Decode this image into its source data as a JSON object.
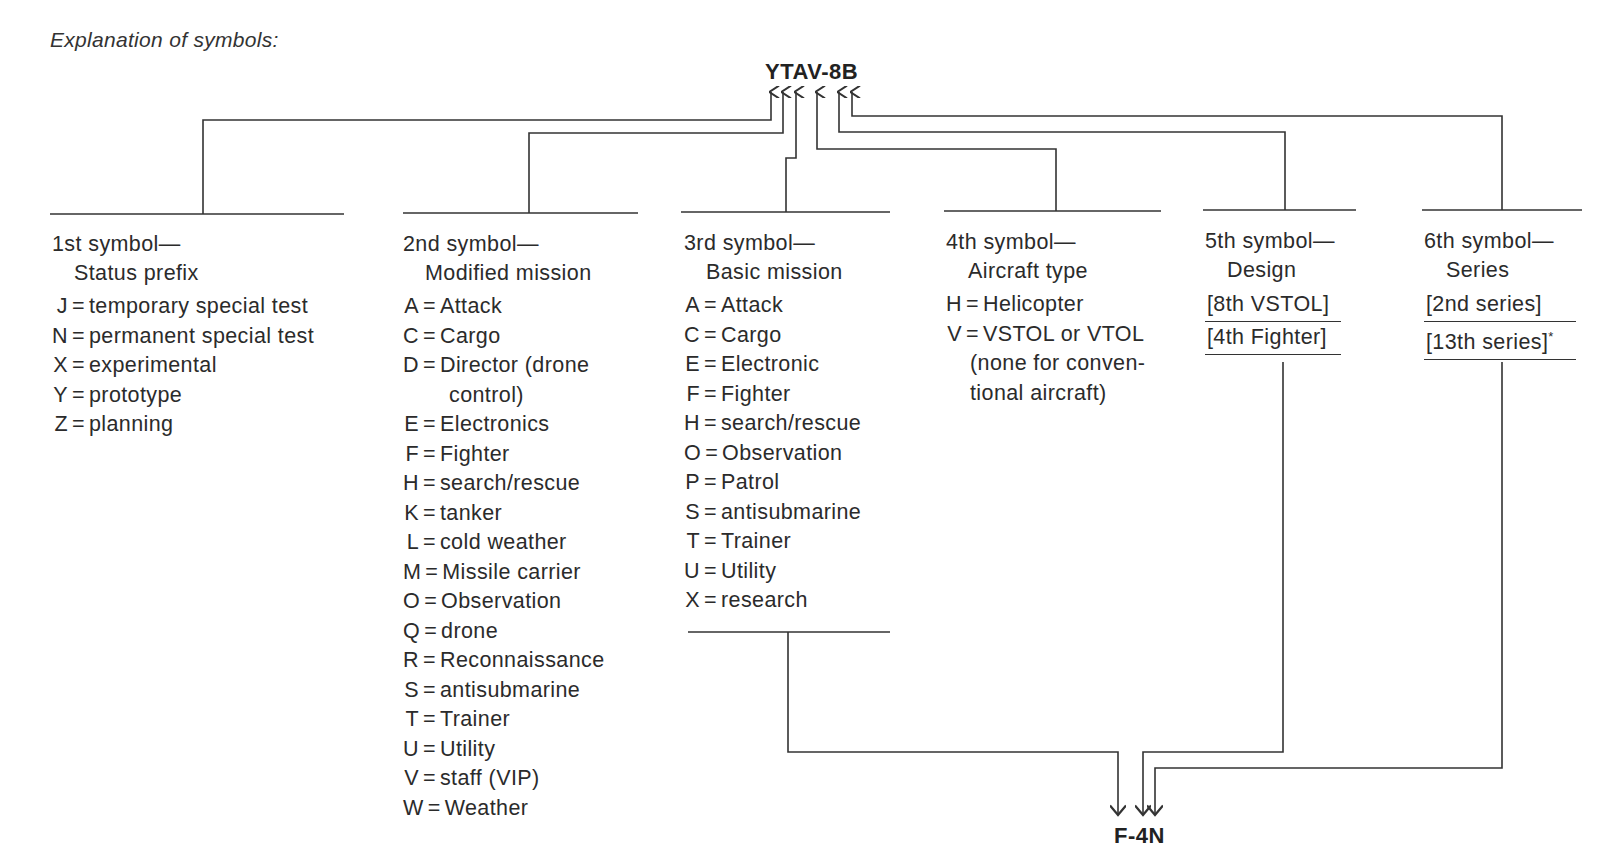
{
  "caption": "Explanation of symbols:",
  "example_top": "YTAV-8B",
  "example_bottom": "F-4N",
  "columns": [
    {
      "heading": "1st symbol—",
      "subheading": "Status prefix",
      "entries": [
        {
          "code": "J",
          "meaning": "temporary special test"
        },
        {
          "code": "N",
          "meaning": "permanent special test"
        },
        {
          "code": "X",
          "meaning": "experimental"
        },
        {
          "code": "Y",
          "meaning": "prototype"
        },
        {
          "code": "Z",
          "meaning": "planning"
        }
      ]
    },
    {
      "heading": "2nd symbol—",
      "subheading": "Modified mission",
      "entries": [
        {
          "code": "A",
          "meaning": "Attack"
        },
        {
          "code": "C",
          "meaning": "Cargo"
        },
        {
          "code": "D",
          "meaning": "Director (drone",
          "continuation": "control)"
        },
        {
          "code": "E",
          "meaning": "Electronics"
        },
        {
          "code": "F",
          "meaning": "Fighter"
        },
        {
          "code": "H",
          "meaning": "search/rescue"
        },
        {
          "code": "K",
          "meaning": "tanker"
        },
        {
          "code": "L",
          "meaning": "cold weather"
        },
        {
          "code": "M",
          "meaning": "Missile carrier"
        },
        {
          "code": "O",
          "meaning": "Observation"
        },
        {
          "code": "Q",
          "meaning": "drone"
        },
        {
          "code": "R",
          "meaning": "Reconnaissance"
        },
        {
          "code": "S",
          "meaning": "antisubmarine"
        },
        {
          "code": "T",
          "meaning": "Trainer"
        },
        {
          "code": "U",
          "meaning": "Utility"
        },
        {
          "code": "V",
          "meaning": "staff (VIP)"
        },
        {
          "code": "W",
          "meaning": "Weather"
        }
      ]
    },
    {
      "heading": "3rd symbol—",
      "subheading": "Basic mission",
      "entries": [
        {
          "code": "A",
          "meaning": "Attack"
        },
        {
          "code": "C",
          "meaning": "Cargo"
        },
        {
          "code": "E",
          "meaning": "Electronic"
        },
        {
          "code": "F",
          "meaning": "Fighter"
        },
        {
          "code": "H",
          "meaning": "search/rescue"
        },
        {
          "code": "O",
          "meaning": "Observation"
        },
        {
          "code": "P",
          "meaning": "Patrol"
        },
        {
          "code": "S",
          "meaning": "antisubmarine"
        },
        {
          "code": "T",
          "meaning": "Trainer"
        },
        {
          "code": "U",
          "meaning": "Utility"
        },
        {
          "code": "X",
          "meaning": "research"
        }
      ]
    },
    {
      "heading": "4th symbol—",
      "subheading": "Aircraft type",
      "entries": [
        {
          "code": "H",
          "meaning": "Helicopter"
        },
        {
          "code": "V",
          "meaning": "VSTOL or VTOL"
        }
      ],
      "note_lines": [
        "(none for conven-",
        "tional aircraft)"
      ]
    },
    {
      "heading": "5th symbol—",
      "subheading": "Design",
      "brackets": [
        "[8th VSTOL]",
        "[4th Fighter]"
      ]
    },
    {
      "heading": "6th symbol—",
      "subheading": "Series",
      "brackets": [
        "[2nd series]",
        "[13th series]"
      ],
      "footnote_mark": "*"
    }
  ],
  "icons": {
    "arrow_up": "arrow-up-icon",
    "arrow_down": "arrow-down-icon"
  },
  "colors": {
    "ink": "#2b2b2b",
    "line": "#333333",
    "background": "#ffffff"
  }
}
